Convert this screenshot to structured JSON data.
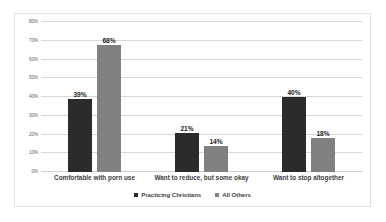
{
  "chart_data": {
    "type": "bar",
    "title": "",
    "subtitle": "",
    "xlabel": "",
    "ylabel": "",
    "ylim": [
      0,
      80
    ],
    "grid": true,
    "legend_position": "bottom",
    "categories": [
      "Comfortable with porn use",
      "Want to reduce, but some okay",
      "Want to stop altogether"
    ],
    "ytick_labels": [
      "0%",
      "10%",
      "20%",
      "30%",
      "40%",
      "50%",
      "60%",
      "70%",
      "80%"
    ],
    "ytick_values": [
      0,
      10,
      20,
      30,
      40,
      50,
      60,
      70,
      80
    ],
    "series": [
      {
        "name": "Practicing Christians",
        "color": "#2b2b2b",
        "values": [
          39,
          21,
          40
        ],
        "data_labels": [
          "39%",
          "21%",
          "40%"
        ]
      },
      {
        "name": "All Others",
        "color": "#808080",
        "values": [
          68,
          14,
          18
        ],
        "data_labels": [
          "68%",
          "14%",
          "18%"
        ]
      }
    ]
  }
}
